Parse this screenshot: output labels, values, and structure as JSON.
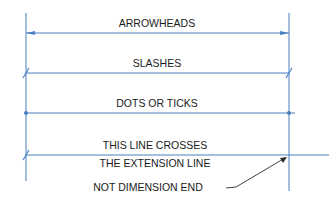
{
  "diagram": {
    "colors": {
      "line": "#4a7fc1",
      "text": "#1a1a1a",
      "leader": "#2a2a2a"
    },
    "rows": [
      {
        "label": "ARROWHEADS",
        "terminator": "arrowhead"
      },
      {
        "label": "SLASHES",
        "terminator": "slash"
      },
      {
        "label": "DOTS OR TICKS",
        "terminator": "dot"
      },
      {
        "label": "THIS LINE CROSSES",
        "terminator": "slash"
      }
    ],
    "note": {
      "line1": "THE EXTENSION LINE",
      "line2": "NOT DIMENSION END"
    }
  }
}
